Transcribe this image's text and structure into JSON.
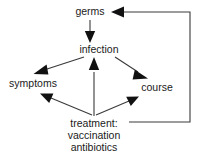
{
  "diagram": {
    "background_color": "#ffffff",
    "line_color": "#3a3a3a",
    "text_color": "#1a1a1a",
    "nodes": [
      {
        "id": "germs",
        "label": "germs",
        "x": 90,
        "y": 12,
        "anchor": "middle"
      },
      {
        "id": "infection",
        "label": "infection",
        "x": 99,
        "y": 50,
        "anchor": "middle"
      },
      {
        "id": "symptoms",
        "label": "symptoms",
        "x": 33,
        "y": 84,
        "anchor": "middle"
      },
      {
        "id": "course",
        "label": "course",
        "x": 157,
        "y": 88,
        "anchor": "middle"
      },
      {
        "id": "treatment_line1",
        "label": "treatment:",
        "x": 94,
        "y": 124,
        "anchor": "middle"
      },
      {
        "id": "treatment_line2",
        "label": "vaccination",
        "x": 94,
        "y": 136,
        "anchor": "middle"
      },
      {
        "id": "treatment_line3",
        "label": "antibiotics",
        "x": 94,
        "y": 148,
        "anchor": "middle"
      }
    ],
    "edges": [
      {
        "id": "germs-to-infection",
        "from": "germs",
        "to": "infection",
        "label": ""
      },
      {
        "id": "infection-to-symptoms",
        "from": "infection",
        "to": "symptoms",
        "label": ""
      },
      {
        "id": "infection-to-course",
        "from": "infection",
        "to": "course",
        "label": ""
      },
      {
        "id": "treatment-to-symptoms",
        "from": "treatment",
        "to": "symptoms",
        "label": ""
      },
      {
        "id": "treatment-to-infection",
        "from": "treatment",
        "to": "infection",
        "label": ""
      },
      {
        "id": "treatment-to-course",
        "from": "treatment",
        "to": "course",
        "label": ""
      },
      {
        "id": "treatment-to-germs",
        "from": "treatment",
        "to": "germs",
        "label": ""
      }
    ]
  }
}
